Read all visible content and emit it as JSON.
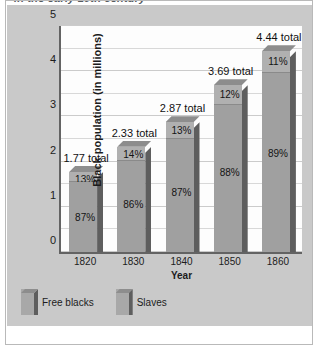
{
  "figure": {
    "title": "in the early 19th century",
    "frame_border_color": "#b9b9b9",
    "panel_color": "#c9c9c9"
  },
  "chart_data": {
    "type": "bar",
    "subtype": "stacked-3d-bar",
    "title": "",
    "xlabel": "Year",
    "ylabel": "Black population (in millions)",
    "ylim": [
      0,
      5
    ],
    "ytick_labels": [
      "0",
      "1",
      "2",
      "3",
      "4",
      "5"
    ],
    "yticks": [
      0,
      1,
      2,
      3,
      4,
      5
    ],
    "grid": "horizontal",
    "grid_step": 0.5,
    "legend_position": "below-plot-left",
    "categories": [
      "1820",
      "1830",
      "1840",
      "1850",
      "1860"
    ],
    "totals": [
      1.77,
      2.33,
      2.87,
      3.69,
      4.44
    ],
    "total_labels": [
      "1.77 total",
      "2.33 total",
      "2.87 total",
      "3.69 total",
      "4.44 total"
    ],
    "series": [
      {
        "name": "Free blacks",
        "percent_labels": [
          "13%",
          "14%",
          "13%",
          "12%",
          "11%"
        ],
        "percents": [
          13,
          14,
          13,
          12,
          11
        ],
        "color": "#b0b0b0"
      },
      {
        "name": "Slaves",
        "percent_labels": [
          "87%",
          "86%",
          "87%",
          "88%",
          "89%"
        ],
        "percents": [
          87,
          86,
          87,
          88,
          89
        ],
        "color": "#a0a0a0"
      }
    ]
  },
  "legend": {
    "items": [
      {
        "label": "Free blacks"
      },
      {
        "label": "Slaves"
      }
    ]
  }
}
